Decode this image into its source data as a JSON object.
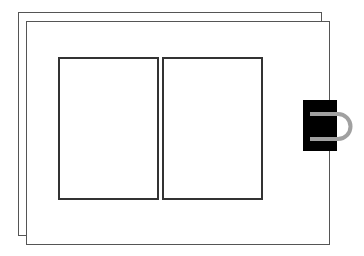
{
  "diagram": {
    "colors": {
      "background": "#ffffff",
      "page_border": "#555555",
      "panel_border": "#333333",
      "clip_body": "#000000",
      "clip_handle": "#a0a0a0"
    },
    "back_page": {
      "x": 18,
      "y": 12,
      "w": 304,
      "h": 224
    },
    "front_page": {
      "x": 26,
      "y": 21,
      "w": 304,
      "h": 224
    },
    "panels": [
      {
        "name": "left-panel",
        "x": 58,
        "y": 57,
        "w": 101,
        "h": 143
      },
      {
        "name": "right-panel",
        "x": 162,
        "y": 57,
        "w": 101,
        "h": 143
      }
    ],
    "binder_clip": {
      "body": {
        "x": 303,
        "y": 100,
        "w": 34,
        "h": 51
      },
      "handle": {
        "top_y": 114,
        "bottom_y": 139,
        "start_x": 310,
        "end_x": 355
      }
    }
  }
}
